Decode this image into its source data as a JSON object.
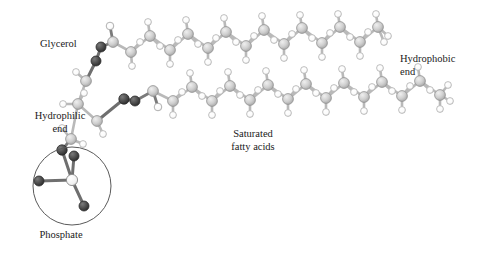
{
  "figure": {
    "kind": "molecular-ball-and-stick-diagram",
    "background_color": "#ffffff"
  },
  "labels": [
    {
      "id": "glycerol",
      "text": "Glycerol",
      "x": 40,
      "y": 38,
      "align": "left",
      "width": 62
    },
    {
      "id": "hydrophilic",
      "text": "Hydrophilic\nend",
      "x": 29,
      "y": 110,
      "align": "center",
      "width": 62
    },
    {
      "id": "phosphate",
      "text": "Phosphate",
      "x": 26,
      "y": 229,
      "align": "center",
      "width": 70
    },
    {
      "id": "saturated",
      "text": "Saturated\nfatty acids",
      "x": 214,
      "y": 128,
      "align": "center",
      "width": 78
    },
    {
      "id": "hydrophobic",
      "text": "Hydrophobic\nend",
      "x": 400,
      "y": 53,
      "align": "left",
      "width": 72
    }
  ],
  "colors": {
    "carbon": "#c9c9c9",
    "carbon_edge": "#8f8f8f",
    "hydrogen": "#fbfbfb",
    "hydrogen_edge": "#a8a8a8",
    "oxygen": "#4a4a4a",
    "oxygen_edge": "#303030",
    "phosphorus": "#efefef",
    "phosphorus_edge": "#8a8a8a",
    "bond": "#b4b4b4",
    "bond_dark": "#6f6f6f",
    "circle_outline": "#5a5a5a",
    "text": "#1a1a1a"
  },
  "highlight_circle": {
    "cx": 72,
    "cy": 186,
    "r": 39,
    "stroke": "#5a5a5a",
    "stroke_width": 1
  },
  "atom_radii": {
    "carbon": 5.4,
    "hydrogen": 3.3,
    "oxygen": 5.0,
    "phosphorus": 5.6
  },
  "structure": {
    "note": "Phospholipid: phosphate head, glycerol backbone, two saturated fatty-acid tails",
    "chain_top_carbons": 16,
    "chain_bottom_carbons": 16,
    "ester_oxygens": 4,
    "phosphate_oxygens": 4
  },
  "atoms": [
    {
      "el": "P",
      "x": 72,
      "y": 180
    },
    {
      "el": "O",
      "x": 39,
      "y": 181
    },
    {
      "el": "O",
      "x": 84,
      "y": 206
    },
    {
      "el": "O",
      "x": 74,
      "y": 156
    },
    {
      "el": "O",
      "x": 62,
      "y": 150
    },
    {
      "el": "C",
      "x": 71,
      "y": 139
    },
    {
      "el": "H",
      "x": 62,
      "y": 128
    },
    {
      "el": "H",
      "x": 83,
      "y": 144
    },
    {
      "el": "C",
      "x": 97,
      "y": 121
    },
    {
      "el": "H",
      "x": 103,
      "y": 134
    },
    {
      "el": "O",
      "x": 124,
      "y": 99
    },
    {
      "el": "O",
      "x": 135,
      "y": 101
    },
    {
      "el": "C",
      "x": 153,
      "y": 91
    },
    {
      "el": "O",
      "x": 158,
      "y": 107
    },
    {
      "el": "C",
      "x": 78,
      "y": 104
    },
    {
      "el": "H",
      "x": 63,
      "y": 104
    },
    {
      "el": "H",
      "x": 84,
      "y": 93
    },
    {
      "el": "C",
      "x": 86,
      "y": 81
    },
    {
      "el": "H",
      "x": 76,
      "y": 72
    },
    {
      "el": "O",
      "x": 96,
      "y": 61
    },
    {
      "el": "O",
      "x": 101,
      "y": 47
    },
    {
      "el": "C",
      "x": 113,
      "y": 42
    },
    {
      "el": "O",
      "x": 110,
      "y": 26
    },
    {
      "el": "C",
      "x": 131,
      "y": 52
    },
    {
      "el": "H",
      "x": 132,
      "y": 66
    },
    {
      "el": "H",
      "x": 140,
      "y": 42
    },
    {
      "el": "C",
      "x": 150,
      "y": 36
    },
    {
      "el": "H",
      "x": 148,
      "y": 22
    },
    {
      "el": "H",
      "x": 160,
      "y": 46
    },
    {
      "el": "C",
      "x": 170,
      "y": 50
    },
    {
      "el": "H",
      "x": 170,
      "y": 64
    },
    {
      "el": "H",
      "x": 178,
      "y": 40
    },
    {
      "el": "C",
      "x": 188,
      "y": 34
    },
    {
      "el": "H",
      "x": 186,
      "y": 20
    },
    {
      "el": "H",
      "x": 198,
      "y": 44
    },
    {
      "el": "C",
      "x": 208,
      "y": 48
    },
    {
      "el": "H",
      "x": 208,
      "y": 62
    },
    {
      "el": "H",
      "x": 216,
      "y": 38
    },
    {
      "el": "C",
      "x": 226,
      "y": 32
    },
    {
      "el": "H",
      "x": 224,
      "y": 18
    },
    {
      "el": "H",
      "x": 236,
      "y": 42
    },
    {
      "el": "C",
      "x": 246,
      "y": 46
    },
    {
      "el": "H",
      "x": 246,
      "y": 60
    },
    {
      "el": "H",
      "x": 254,
      "y": 36
    },
    {
      "el": "C",
      "x": 264,
      "y": 30
    },
    {
      "el": "H",
      "x": 262,
      "y": 16
    },
    {
      "el": "H",
      "x": 274,
      "y": 40
    },
    {
      "el": "C",
      "x": 284,
      "y": 44
    },
    {
      "el": "H",
      "x": 284,
      "y": 58
    },
    {
      "el": "H",
      "x": 292,
      "y": 34
    },
    {
      "el": "C",
      "x": 302,
      "y": 28
    },
    {
      "el": "H",
      "x": 300,
      "y": 15
    },
    {
      "el": "H",
      "x": 312,
      "y": 38
    },
    {
      "el": "C",
      "x": 322,
      "y": 43
    },
    {
      "el": "H",
      "x": 322,
      "y": 57
    },
    {
      "el": "H",
      "x": 330,
      "y": 33
    },
    {
      "el": "C",
      "x": 340,
      "y": 27
    },
    {
      "el": "H",
      "x": 338,
      "y": 14
    },
    {
      "el": "H",
      "x": 350,
      "y": 37
    },
    {
      "el": "C",
      "x": 360,
      "y": 42
    },
    {
      "el": "H",
      "x": 360,
      "y": 56
    },
    {
      "el": "H",
      "x": 368,
      "y": 32
    },
    {
      "el": "C",
      "x": 378,
      "y": 27
    },
    {
      "el": "H",
      "x": 376,
      "y": 14
    },
    {
      "el": "H",
      "x": 388,
      "y": 36
    },
    {
      "el": "H",
      "x": 384,
      "y": 42
    }
  ]
}
